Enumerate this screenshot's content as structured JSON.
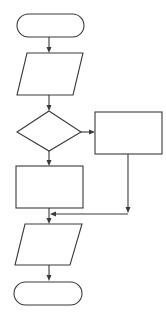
{
  "diagram": {
    "type": "flowchart",
    "stroke_color": "#3a3a3a",
    "background": "#ffffff",
    "nodes": [
      {
        "id": "start",
        "shape": "terminator",
        "label": ""
      },
      {
        "id": "input",
        "shape": "parallelogram",
        "label": ""
      },
      {
        "id": "decision",
        "shape": "diamond",
        "label": ""
      },
      {
        "id": "process-right",
        "shape": "rectangle",
        "label": ""
      },
      {
        "id": "process-left",
        "shape": "rectangle",
        "label": ""
      },
      {
        "id": "output",
        "shape": "parallelogram",
        "label": ""
      },
      {
        "id": "end",
        "shape": "terminator",
        "label": ""
      }
    ],
    "edges": [
      {
        "from": "start",
        "to": "input"
      },
      {
        "from": "input",
        "to": "decision"
      },
      {
        "from": "decision",
        "to": "process-right",
        "direction": "right"
      },
      {
        "from": "decision",
        "to": "process-left",
        "direction": "down"
      },
      {
        "from": "process-right",
        "to": "merge"
      },
      {
        "from": "process-left",
        "to": "merge"
      },
      {
        "from": "merge",
        "to": "output"
      },
      {
        "from": "output",
        "to": "end"
      }
    ]
  }
}
